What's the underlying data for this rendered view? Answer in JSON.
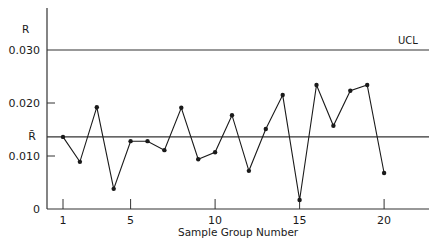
{
  "chart_data": {
    "type": "line",
    "title": "",
    "xlabel": "Sample Group Number",
    "ylabel": "R",
    "ylim": [
      0,
      0.034
    ],
    "xlim": [
      0,
      24
    ],
    "grid": false,
    "x": [
      1,
      2,
      3,
      4,
      5,
      6,
      7,
      8,
      9,
      10,
      11,
      12,
      13,
      14,
      15,
      16,
      17,
      18,
      19,
      20
    ],
    "series": [
      {
        "name": "R",
        "values": [
          0.0136,
          0.0089,
          0.0192,
          0.0038,
          0.0128,
          0.0128,
          0.0111,
          0.0191,
          0.0094,
          0.0107,
          0.0177,
          0.0072,
          0.0151,
          0.0215,
          0.0017,
          0.0234,
          0.0157,
          0.0223,
          0.0234,
          0.0068
        ]
      }
    ],
    "x_ticks": [
      1,
      5,
      10,
      15,
      20
    ],
    "x_tick_labels": [
      "1",
      "5",
      "10",
      "15",
      "20"
    ],
    "y_ticks": [
      0,
      0.01,
      0.02,
      0.03
    ],
    "y_tick_labels": [
      "0",
      "0.010",
      "0.020",
      "0.030"
    ],
    "reference_lines": [
      {
        "name": "UCL",
        "label": "UCL",
        "value": 0.03
      },
      {
        "name": "R-bar",
        "label": "R̄",
        "value": 0.0136
      }
    ],
    "colors": {
      "line": "#1a1a1a",
      "axis": "#333333",
      "background": "#ffffff"
    }
  },
  "labels": {
    "y_axis_title": "R",
    "x_axis_title": "Sample Group Number",
    "ucl": "UCL",
    "rbar": "R̄"
  }
}
